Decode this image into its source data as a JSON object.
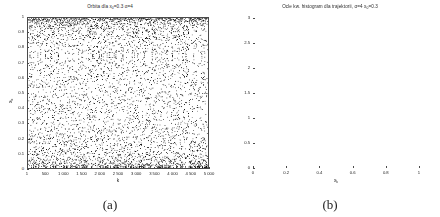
{
  "figure": {
    "panels": [
      {
        "caption": "(a)",
        "title_main": "Orbita dla x",
        "title_sub": "0",
        "title_rest": "=0.3 α=4",
        "xlabel_main": "k",
        "xlabel_sub": "",
        "ylabel_main": "x",
        "ylabel_sub": "k"
      },
      {
        "caption": "(b)",
        "title_main": "Ocle kw. histogram dla trajektorii, α=4 x",
        "title_sub": "0",
        "title_rest": "=0.3",
        "xlabel_main": "x",
        "xlabel_sub": "k",
        "ylabel_main": "",
        "ylabel_sub": ""
      }
    ]
  },
  "chart_data": [
    {
      "type": "scatter",
      "title": "Orbita dla x0=0.3 α=4",
      "xlabel": "k",
      "ylabel": "x_k",
      "xlim": [
        1,
        5000
      ],
      "ylim": [
        0,
        1
      ],
      "xticks": [
        1,
        500,
        1000,
        1500,
        2000,
        2500,
        3000,
        3500,
        4000,
        4500,
        5000
      ],
      "xticklabels": [
        "1",
        "500",
        "1 000",
        "1 500",
        "2 000",
        "2 500",
        "3 000",
        "3 500",
        "4 000",
        "4 500",
        "5 000"
      ],
      "yticks": [
        0,
        0.1,
        0.2,
        0.3,
        0.4,
        0.5,
        0.6,
        0.7,
        0.8,
        0.9,
        1
      ],
      "yticklabels": [
        "0",
        "0.1",
        "0.2",
        "0.3",
        "0.4",
        "0.5",
        "0.6",
        "0.7",
        "0.8",
        "0.9",
        "1"
      ],
      "grid": false,
      "n_points": 5000,
      "marker": "dot",
      "marker_color": "#000000",
      "description": "Chaotic orbit of the logistic map x_{k+1}=4*x_k*(1-x_k) with x_0=0.3; points fill the unit interval densely with higher concentration near x=0 and x=1."
    },
    {
      "type": "bar",
      "title": "Ocle kw. histogram dla trajektorii, α=4 x0=0.3",
      "xlabel": "x_k",
      "ylabel": "",
      "xlim": [
        0,
        1
      ],
      "ylim": [
        0,
        3
      ],
      "xticks": [
        0,
        0.2,
        0.4,
        0.6,
        0.8,
        1
      ],
      "xticklabels": [
        "0",
        "0.2",
        "0.4",
        "0.6",
        "0.8",
        "1"
      ],
      "yticks": [
        0,
        0.5,
        1,
        1.5,
        2,
        2.5,
        3
      ],
      "yticklabels": [
        "0",
        "0.5",
        "1",
        "1.5",
        "2",
        "2.5",
        "3"
      ],
      "grid": false,
      "bar_color": "#b6b6b6",
      "bar_edge_color": "#6a6a6a",
      "categories": [
        "0.000-0.050",
        "0.050-0.100",
        "0.100-0.150",
        "0.150-0.200",
        "0.200-0.250",
        "0.250-0.300",
        "0.300-0.350",
        "0.350-0.400",
        "0.400-0.450",
        "0.450-0.500",
        "0.500-0.550",
        "0.550-0.600",
        "0.600-0.650",
        "0.650-0.700",
        "0.700-0.750",
        "0.750-0.800",
        "0.800-0.850",
        "0.850-0.900",
        "0.900-0.950",
        "0.950-1.000"
      ],
      "values": [
        2.8,
        1.22,
        0.96,
        0.88,
        0.75,
        0.72,
        0.63,
        0.67,
        0.66,
        0.66,
        0.58,
        0.63,
        0.67,
        0.68,
        0.7,
        0.76,
        0.76,
        1.02,
        1.18,
        2.86
      ],
      "description": "Empirical density of the logistic map orbit, U-shaped, approximating the arcsine invariant density."
    }
  ]
}
